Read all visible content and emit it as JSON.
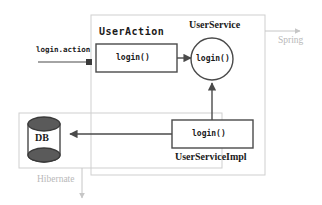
{
  "diagram": {
    "title_implicit": "Spring MVC layered call flow",
    "entry": {
      "request_label": "login.action"
    },
    "containers": [
      {
        "name": "spring-container",
        "label": "Spring",
        "label_color": "#b9b9b9",
        "border_color": "#cfcfcf"
      },
      {
        "name": "hibernate-container",
        "label": "Hibernate",
        "label_color": "#b9b9b9",
        "border_color": "#cfcfcf"
      }
    ],
    "nodes": [
      {
        "id": "user-action",
        "title": "UserAction",
        "method": "login()",
        "shape": "rect"
      },
      {
        "id": "user-service",
        "title": "UserService",
        "method": "login()",
        "shape": "circle"
      },
      {
        "id": "user-service-impl",
        "title": "UserServiceImpl",
        "method": "login()",
        "shape": "rect"
      },
      {
        "id": "database",
        "title": "DB",
        "shape": "cylinder"
      }
    ],
    "edges": [
      {
        "from": "request",
        "to": "user-action",
        "kind": "solid-arrow"
      },
      {
        "from": "user-action",
        "to": "user-service",
        "kind": "solid-arrow"
      },
      {
        "from": "user-service-impl",
        "to": "user-service",
        "kind": "solid-arrow"
      },
      {
        "from": "user-service-impl",
        "to": "database",
        "kind": "solid-arrow"
      },
      {
        "from": "spring-container",
        "to": "spring-label",
        "kind": "gray-arrow"
      },
      {
        "from": "hibernate-container",
        "to": "hibernate-label",
        "kind": "gray-arrow"
      }
    ],
    "colors": {
      "stroke": "#4a4a4a",
      "container_stroke": "#cfcfcf",
      "gray_label": "#b9b9b9",
      "db_fill": "#555555",
      "background": "#ffffff"
    }
  }
}
